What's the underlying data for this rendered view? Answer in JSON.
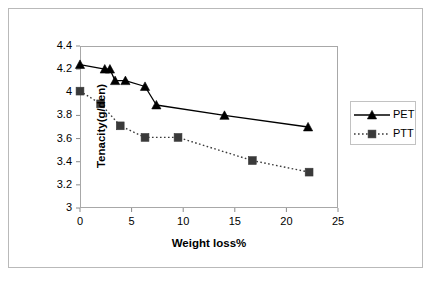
{
  "chart_data": {
    "type": "line",
    "title": "",
    "xlabel": "Weight loss%",
    "ylabel": "Tenacity(g/den)",
    "xlim": [
      0,
      25
    ],
    "ylim": [
      3,
      4.4
    ],
    "xticks": [
      "0",
      "5",
      "10",
      "15",
      "20",
      "25"
    ],
    "xtick_values": [
      0,
      5,
      10,
      15,
      20,
      25
    ],
    "yticks": [
      "3",
      "3.2",
      "3.4",
      "3.6",
      "3.8",
      "4",
      "4.2",
      "4.4"
    ],
    "ytick_values": [
      3,
      3.2,
      3.4,
      3.6,
      3.8,
      4,
      4.2,
      4.4
    ],
    "grid": false,
    "legend_position": "right",
    "series": [
      {
        "name": "PET",
        "marker": "triangle",
        "linestyle": "solid",
        "color": "#000000",
        "points": [
          [
            0.0,
            4.24
          ],
          [
            2.4,
            4.2
          ],
          [
            2.9,
            4.2
          ],
          [
            3.4,
            4.1
          ],
          [
            4.4,
            4.1
          ],
          [
            6.3,
            4.05
          ],
          [
            7.4,
            3.89
          ],
          [
            14.0,
            3.8
          ],
          [
            22.1,
            3.7
          ]
        ]
      },
      {
        "name": "PTT",
        "marker": "square",
        "linestyle": "dotted",
        "color": "#3a3a3a",
        "points": [
          [
            0.0,
            4.01
          ],
          [
            2.0,
            3.9
          ],
          [
            3.9,
            3.71
          ],
          [
            6.3,
            3.61
          ],
          [
            9.5,
            3.61
          ],
          [
            16.7,
            3.41
          ],
          [
            22.2,
            3.31
          ]
        ]
      }
    ]
  },
  "legend": {
    "entries": [
      {
        "label": "PET"
      },
      {
        "label": "PTT"
      }
    ]
  }
}
